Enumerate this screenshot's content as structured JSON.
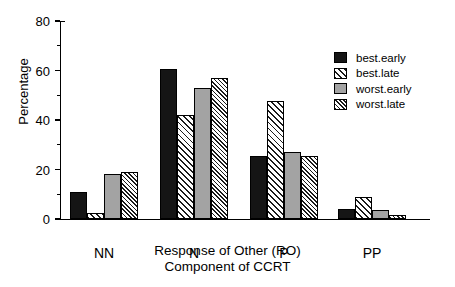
{
  "chart_data": {
    "type": "bar",
    "title": "",
    "xlabel": "Response of Other (RO) Component of CCRT",
    "xlabel_lines": [
      "Response of Other (RO)",
      "Component of CCRT"
    ],
    "ylabel": "Percentage",
    "categories": [
      "NN",
      "N",
      "P",
      "PP"
    ],
    "ylim": [
      0,
      80
    ],
    "yticks": [
      0,
      20,
      40,
      60,
      80
    ],
    "ytick_labels": [
      "0",
      "20",
      "40",
      "60",
      "80"
    ],
    "yminor_ticks": [
      10,
      30,
      50,
      70
    ],
    "grid": false,
    "legend_position": "top-right",
    "series": [
      {
        "name": "best.early",
        "fill": "solid-black",
        "color": "#151515",
        "values": [
          11,
          60.5,
          25.5,
          4
        ]
      },
      {
        "name": "best.late",
        "fill": "hatch-wide",
        "color": "#ffffff",
        "values": [
          2.5,
          42,
          47.5,
          9
        ]
      },
      {
        "name": "worst.early",
        "fill": "solid-gray",
        "color": "#a3a3a3",
        "values": [
          18,
          53,
          27,
          3.5
        ]
      },
      {
        "name": "worst.late",
        "fill": "hatch-fine",
        "color": "#ffffff",
        "values": [
          19,
          57,
          25.5,
          1.5
        ]
      }
    ]
  }
}
